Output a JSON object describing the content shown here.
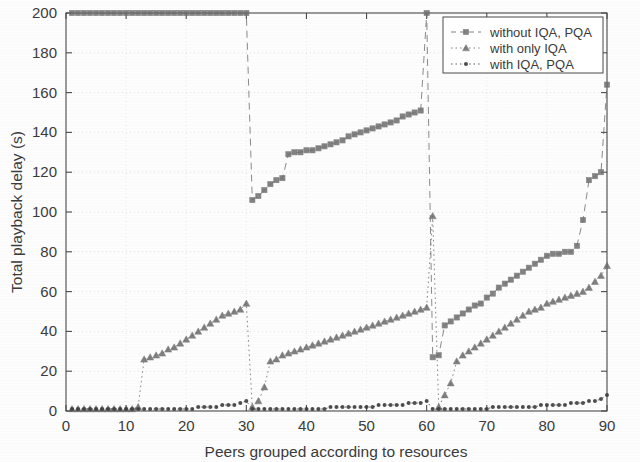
{
  "figure": {
    "background_color": "#fdfdfd",
    "axis_color": "#4a4a4a",
    "grid_color": "#c9c9c9",
    "text_color": "#3b3b3b"
  },
  "axes": {
    "x_label": "Peers grouped according to resources",
    "y_label": "Total playback delay (s)",
    "x_ticks": [
      "0",
      "10",
      "20",
      "30",
      "40",
      "50",
      "60",
      "70",
      "80",
      "90"
    ],
    "y_ticks": [
      "0",
      "20",
      "40",
      "60",
      "80",
      "100",
      "120",
      "140",
      "160",
      "180",
      "200"
    ]
  },
  "legend": {
    "items": [
      {
        "label": "without IQA, PQA",
        "marker": "square",
        "linestyle": "dashed",
        "color": "#6e6e6e"
      },
      {
        "label": "with only IQA",
        "marker": "triangle",
        "linestyle": "dotted",
        "color": "#6a6a6a"
      },
      {
        "label": "with IQA, PQA",
        "marker": "circle",
        "linestyle": "dotted",
        "color": "#3d3d3d"
      }
    ]
  },
  "chart_data": {
    "type": "line",
    "title": "",
    "xlabel": "Peers grouped according to resources",
    "ylabel": "Total playback delay (s)",
    "xlim": [
      0,
      90
    ],
    "ylim": [
      0,
      200
    ],
    "xticks": [
      0,
      10,
      20,
      30,
      40,
      50,
      60,
      70,
      80,
      90
    ],
    "yticks": [
      0,
      20,
      40,
      60,
      80,
      100,
      120,
      140,
      160,
      180,
      200
    ],
    "grid": true,
    "legend_position": "top-right",
    "note": "Sawtooth pattern: all series reset at x=30 and x=60 (three groups of 30 peers).",
    "x": [
      1,
      2,
      3,
      4,
      5,
      6,
      7,
      8,
      9,
      10,
      11,
      12,
      13,
      14,
      15,
      16,
      17,
      18,
      19,
      20,
      21,
      22,
      23,
      24,
      25,
      26,
      27,
      28,
      29,
      30,
      31,
      32,
      33,
      34,
      35,
      36,
      37,
      38,
      39,
      40,
      41,
      42,
      43,
      44,
      45,
      46,
      47,
      48,
      49,
      50,
      51,
      52,
      53,
      54,
      55,
      56,
      57,
      58,
      59,
      60,
      61,
      62,
      63,
      64,
      65,
      66,
      67,
      68,
      69,
      70,
      71,
      72,
      73,
      74,
      75,
      76,
      77,
      78,
      79,
      80,
      81,
      82,
      83,
      84,
      85,
      86,
      87,
      88,
      89,
      90
    ],
    "series": [
      {
        "name": "without IQA, PQA",
        "marker": "square",
        "linestyle": "dashed",
        "color": "#6e6e6e",
        "values": [
          200,
          200,
          200,
          200,
          200,
          200,
          200,
          200,
          200,
          200,
          200,
          200,
          200,
          200,
          200,
          200,
          200,
          200,
          200,
          200,
          200,
          200,
          200,
          200,
          200,
          200,
          200,
          200,
          200,
          200,
          106,
          108,
          111,
          114,
          116,
          117,
          129,
          130,
          130,
          131,
          131,
          132,
          133,
          134,
          135,
          136,
          138,
          139,
          140,
          141,
          142,
          143,
          144,
          145,
          146,
          148,
          149,
          150,
          151,
          200,
          27,
          28,
          43,
          45,
          47,
          49,
          51,
          53,
          54,
          57,
          59,
          62,
          64,
          66,
          68,
          70,
          72,
          74,
          76,
          78,
          79,
          79,
          80,
          80,
          83,
          96,
          116,
          118,
          120,
          164
        ]
      },
      {
        "name": "with only IQA",
        "marker": "triangle",
        "linestyle": "dotted",
        "color": "#6a6a6a",
        "values": [
          1,
          1,
          1,
          1,
          1,
          1,
          1,
          1,
          1,
          1,
          1,
          2,
          26,
          27,
          28,
          29,
          31,
          32,
          34,
          36,
          38,
          40,
          42,
          44,
          46,
          48,
          49,
          50,
          51,
          54,
          2,
          5,
          12,
          25,
          26,
          28,
          29,
          30,
          31,
          32,
          33,
          34,
          35,
          36,
          37,
          38,
          39,
          40,
          41,
          42,
          43,
          44,
          45,
          46,
          47,
          48,
          49,
          50,
          51,
          52,
          98,
          2,
          8,
          14,
          25,
          28,
          30,
          32,
          34,
          36,
          38,
          40,
          42,
          44,
          46,
          48,
          50,
          51,
          52,
          54,
          55,
          56,
          57,
          58,
          59,
          60,
          62,
          65,
          68,
          73
        ]
      },
      {
        "name": "with IQA, PQA",
        "marker": "circle",
        "linestyle": "dotted",
        "color": "#3d3d3d",
        "values": [
          1,
          1,
          1,
          1,
          1,
          1,
          1,
          1,
          1,
          1,
          1,
          1,
          1,
          1,
          1,
          1,
          1,
          1,
          1,
          1,
          1,
          2,
          2,
          2,
          2,
          3,
          3,
          3,
          4,
          5,
          1,
          1,
          1,
          1,
          1,
          1,
          1,
          1,
          1,
          1,
          1,
          1,
          1,
          2,
          2,
          2,
          2,
          2,
          2,
          2,
          2,
          3,
          3,
          3,
          3,
          3,
          4,
          4,
          4,
          5,
          1,
          1,
          1,
          1,
          1,
          1,
          1,
          1,
          1,
          1,
          2,
          2,
          2,
          2,
          2,
          2,
          2,
          2,
          3,
          3,
          3,
          3,
          3,
          4,
          4,
          4,
          5,
          5,
          6,
          8
        ]
      }
    ]
  }
}
